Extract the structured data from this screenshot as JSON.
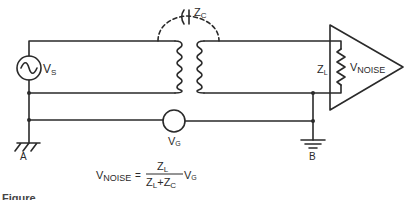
{
  "diagram": {
    "type": "circuit-schematic",
    "components": {
      "source": {
        "label": "V",
        "sub": "S"
      },
      "coupling_capacitance": {
        "label": "Z",
        "sub": "C"
      },
      "load": {
        "label": "Z",
        "sub": "L"
      },
      "noise_voltage": {
        "label": "V",
        "sub": "NOISE"
      },
      "ground_voltage": {
        "label": "V",
        "sub": "G"
      },
      "ground_a": {
        "label": "A"
      },
      "ground_b": {
        "label": "B"
      }
    },
    "formula": {
      "lhs_main": "V",
      "lhs_sub": "NOISE",
      "equals": "=",
      "num_main": "Z",
      "num_sub": "L",
      "den_1_main": "Z",
      "den_1_sub": "L",
      "den_plus": "+",
      "den_2_main": "Z",
      "den_2_sub": "C",
      "rhs_main": "V",
      "rhs_sub": "G"
    },
    "colors": {
      "line": "#2a2a2a",
      "background": "#ffffff"
    }
  },
  "caption": {
    "text": "Figure"
  }
}
